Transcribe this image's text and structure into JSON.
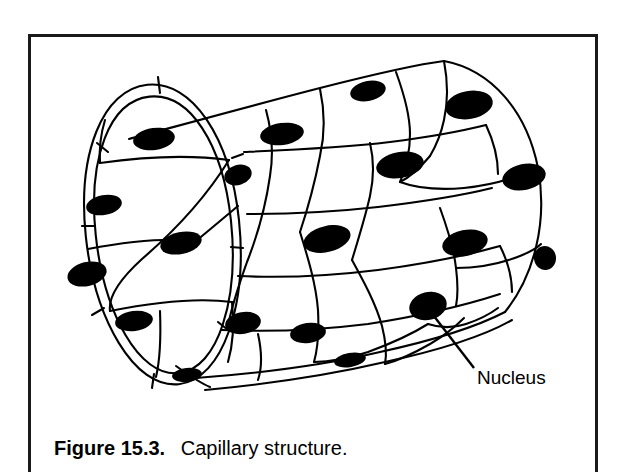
{
  "figure": {
    "caption_label": "Figure 15.3.",
    "caption_text": "Capillary structure.",
    "callouts": [
      {
        "label": "Nucleus",
        "x": 477,
        "y": 384
      }
    ],
    "colors": {
      "background": "#ffffff",
      "ink": "#000000",
      "frame": "#1a1a1a"
    },
    "frame": {
      "left": 28,
      "top": 34,
      "right": 598,
      "bottom": 472
    }
  }
}
